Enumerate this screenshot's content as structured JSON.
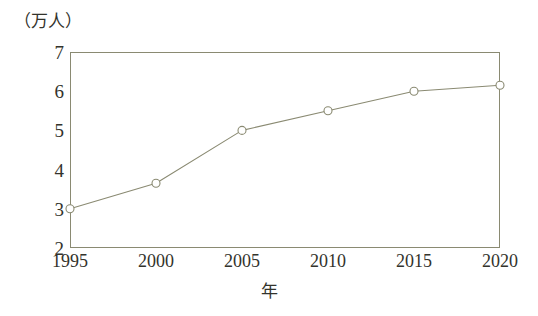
{
  "chart_data": {
    "type": "line",
    "title": "",
    "subtitle": "",
    "unit_label": "（万人）",
    "xlabel": "年",
    "ylabel": "",
    "categories": [
      "1995",
      "2000",
      "2005",
      "2010",
      "2015",
      "2020"
    ],
    "x": [
      1995,
      2000,
      2005,
      2010,
      2015,
      2020
    ],
    "values": [
      3.0,
      3.65,
      5.0,
      5.5,
      6.0,
      6.15
    ],
    "series": [
      {
        "name": "人口",
        "values": [
          3.0,
          3.65,
          5.0,
          5.5,
          6.0,
          6.15
        ]
      }
    ],
    "xtick_labels": [
      "1995",
      "2000",
      "2005",
      "2010",
      "2015",
      "2020"
    ],
    "ytick_labels": [
      "2",
      "3",
      "4",
      "5",
      "6",
      "7"
    ],
    "yticks": [
      2,
      3,
      4,
      5,
      6,
      7
    ],
    "ylim": [
      2,
      7
    ],
    "xlim": [
      1995,
      2020
    ],
    "grid": false,
    "legend": false,
    "legend_position": "none",
    "marker": "open-circle",
    "line_color": "#8a8a72",
    "marker_edge_color": "#8a8a72",
    "marker_fill_color": "#ffffff",
    "frame_color": "#8a8a72",
    "text_color": "#33332c",
    "background_color": "#ffffff"
  }
}
